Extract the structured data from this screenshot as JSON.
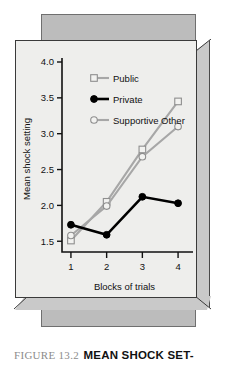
{
  "figure": {
    "caption_number": "FIGURE 13.2",
    "caption_title": "MEAN SHOCK SET-"
  },
  "chart_data": {
    "type": "line",
    "title": "",
    "xlabel": "Blocks of trials",
    "ylabel": "Mean shock setting",
    "x": [
      1,
      2,
      3,
      4
    ],
    "xtick_labels": [
      "1",
      "2",
      "3",
      "4"
    ],
    "ytick_labels": [
      "1.5",
      "2.0",
      "2.5",
      "3.0",
      "3.5",
      "4.0"
    ],
    "ytick_values": [
      1.5,
      2.0,
      2.5,
      3.0,
      3.5,
      4.0
    ],
    "ylim": [
      1.35,
      4.0
    ],
    "xlim": [
      0.75,
      4.25
    ],
    "grid": false,
    "legend_position": "top-center",
    "series": [
      {
        "name": "Public",
        "values": [
          1.51,
          2.05,
          2.78,
          3.45
        ],
        "color": "#a7a7a7",
        "marker": "open-square"
      },
      {
        "name": "Private",
        "values": [
          1.73,
          1.59,
          2.12,
          2.03
        ],
        "color": "#000000",
        "marker": "filled-circle"
      },
      {
        "name": "Supportive Other",
        "values": [
          1.58,
          1.99,
          2.68,
          3.1
        ],
        "color": "#a7a7a7",
        "marker": "open-circle"
      }
    ]
  },
  "legend": {
    "items": [
      {
        "label": "Public"
      },
      {
        "label": "Private"
      },
      {
        "label": "Supportive Other"
      }
    ]
  }
}
